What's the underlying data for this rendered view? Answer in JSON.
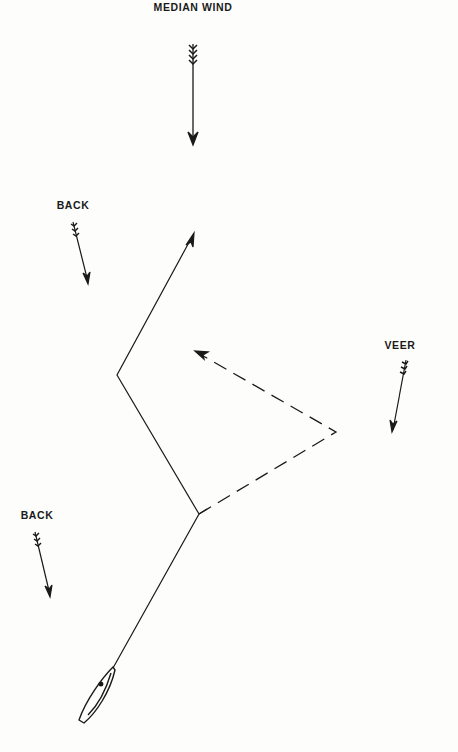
{
  "diagram": {
    "labels": {
      "median_wind": "MEDIAN WIND",
      "back_upper": "BACK",
      "veer": "VEER",
      "back_lower": "BACK"
    },
    "colors": {
      "ink": "#1a1a1a",
      "background": "#fdfdfb"
    },
    "wind_arrows": [
      {
        "id": "median-wind",
        "label": "MEDIAN WIND",
        "from": [
          193,
          44
        ],
        "to": [
          193,
          142
        ]
      },
      {
        "id": "back-upper",
        "label": "BACK",
        "from": [
          73,
          222
        ],
        "to": [
          88,
          282
        ]
      },
      {
        "id": "veer",
        "label": "VEER",
        "from": [
          406,
          360
        ],
        "to": [
          393,
          430
        ]
      },
      {
        "id": "back-lower",
        "label": "BACK",
        "from": [
          35,
          532
        ],
        "to": [
          50,
          595
        ]
      }
    ],
    "courses": {
      "solid": {
        "style": "solid",
        "points": [
          [
            113,
            668
          ],
          [
            199,
            514
          ],
          [
            117,
            375
          ],
          [
            193,
            235
          ]
        ]
      },
      "dashed": {
        "style": "dashed",
        "points": [
          [
            199,
            514
          ],
          [
            336,
            432
          ],
          [
            195,
            352
          ]
        ]
      }
    },
    "boat": {
      "bow": [
        113,
        668
      ],
      "stern": [
        82,
        722
      ]
    }
  }
}
